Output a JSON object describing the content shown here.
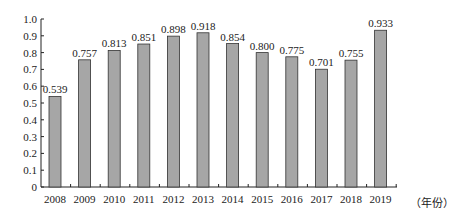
{
  "chart_data": {
    "type": "bar",
    "title": "",
    "xlabel": "（年份）",
    "ylabel": "",
    "categories": [
      "2008",
      "2009",
      "2010",
      "2011",
      "2012",
      "2013",
      "2014",
      "2015",
      "2016",
      "2017",
      "2018",
      "2019"
    ],
    "values": [
      0.539,
      0.757,
      0.813,
      0.851,
      0.898,
      0.918,
      0.854,
      0.8,
      0.775,
      0.701,
      0.755,
      0.933
    ],
    "value_labels": [
      "0.539",
      "0.757",
      "0.813",
      "0.851",
      "0.898",
      "0.918",
      "0.854",
      "0.800",
      "0.775",
      "0.701",
      "0.755",
      "0.933"
    ],
    "ylim": [
      0,
      1.0
    ],
    "yticks": [
      "0",
      "0.1",
      "0.2",
      "0.3",
      "0.4",
      "0.5",
      "0.6",
      "0.7",
      "0.8",
      "0.9",
      "1.0"
    ],
    "grid": false,
    "legend": null,
    "colors": {
      "bar_fill": "#a6a6a6",
      "bar_stroke": "#333333",
      "axis": "#222222"
    }
  }
}
